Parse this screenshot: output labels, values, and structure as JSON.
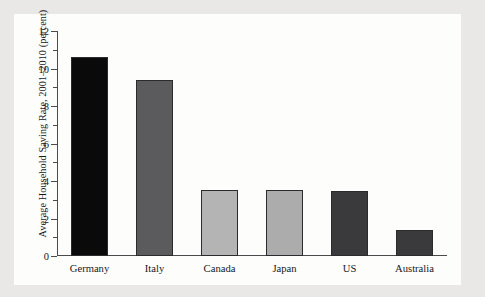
{
  "figure": {
    "background_color": "#e9e8e6",
    "panel_color": "#fdfdfc",
    "axis_color": "#4b4b4d",
    "text_color": "#17171a"
  },
  "chart_data": {
    "type": "bar",
    "title": "",
    "xlabel": "",
    "ylabel": "Average Household Saving Rate, 2001–2010 (percent)",
    "categories": [
      "Germany",
      "Italy",
      "Canada",
      "Japan",
      "US",
      "Australia"
    ],
    "values": [
      10.6,
      9.4,
      3.5,
      3.5,
      3.45,
      1.4
    ],
    "bar_colors": [
      "#0a0a0a",
      "#5b5b5d",
      "#b4b4b4",
      "#acacac",
      "#3a3a3c",
      "#3a3a3c"
    ],
    "bar_edge_color": "#2b2b2d",
    "ylim": [
      0,
      12
    ],
    "yticks": [
      0,
      2,
      4,
      6,
      8,
      10,
      12
    ],
    "ytick_labels": [
      "0",
      "2",
      "4",
      "6",
      "8",
      "10",
      "12"
    ],
    "yminor_ticks": [
      1,
      3,
      5,
      7,
      9,
      11
    ],
    "grid": false,
    "legend": null
  }
}
